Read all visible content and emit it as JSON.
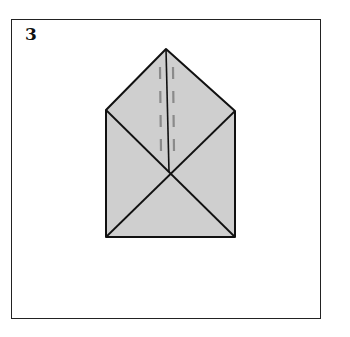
{
  "step": {
    "number": "3"
  },
  "diagram": {
    "colors": {
      "paper_fill": "#cfcfcf",
      "line": "#111111",
      "dash": "#8a8a8a",
      "frame": "#222222"
    }
  }
}
